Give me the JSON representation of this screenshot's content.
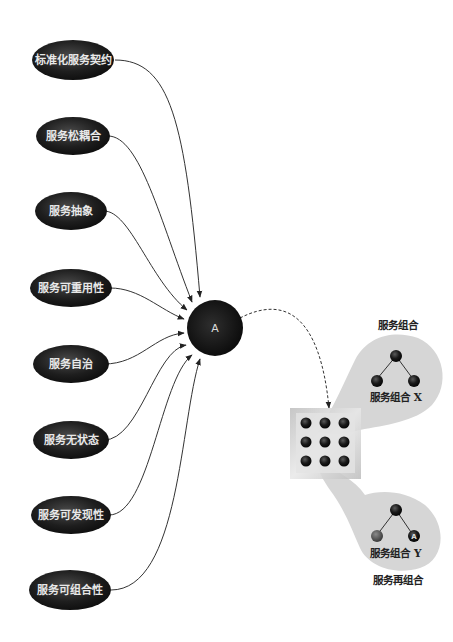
{
  "principles": [
    {
      "label": "标准化服务契约",
      "cx": 73,
      "cy": 60
    },
    {
      "label": "服务松耦合",
      "cx": 73,
      "cy": 136
    },
    {
      "label": "服务抽象",
      "cx": 71,
      "cy": 211
    },
    {
      "label": "服务可重用性",
      "cx": 71,
      "cy": 288
    },
    {
      "label": "服务自治",
      "cx": 71,
      "cy": 364
    },
    {
      "label": "服务无状态",
      "cx": 71,
      "cy": 440
    },
    {
      "label": "服务可发现性",
      "cx": 71,
      "cy": 515
    },
    {
      "label": "服务可组合性",
      "cx": 70,
      "cy": 590
    }
  ],
  "hub": {
    "label": "A"
  },
  "composition_x": {
    "title": "服务组合",
    "label": "服务组合 X"
  },
  "composition_y": {
    "title": "服务再组合",
    "label": "服务组合 Y",
    "node_label": "A"
  },
  "colors": {
    "node_dark": "#1a1a1a",
    "petal": "#d4d4d4",
    "box": "#c8c8c8",
    "line": "#333333"
  }
}
